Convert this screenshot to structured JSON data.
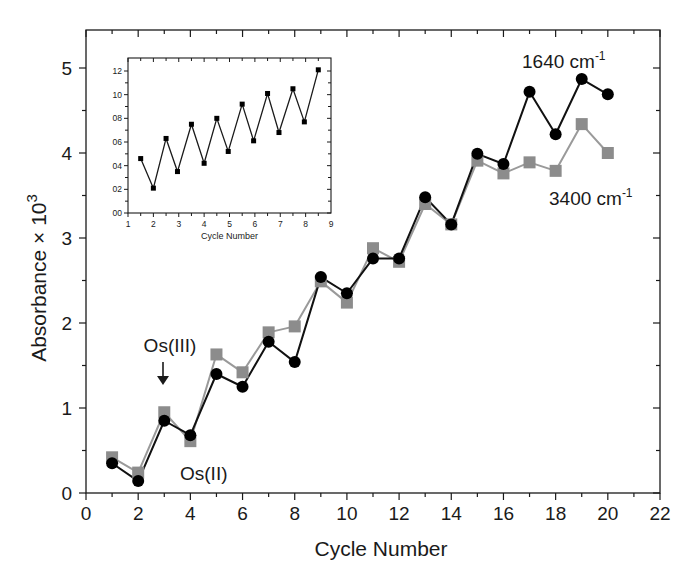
{
  "chart_data": [
    {
      "id": "main",
      "type": "line",
      "title": "",
      "xlabel": "Cycle Number",
      "ylabel": "Absorbance × 10",
      "ylabel_superscript": "3",
      "xlim": [
        0,
        22
      ],
      "ylim": [
        0,
        5.45
      ],
      "x_ticks": [
        0,
        2,
        4,
        6,
        8,
        10,
        12,
        14,
        16,
        18,
        20,
        22
      ],
      "y_ticks": [
        0,
        1,
        2,
        3,
        4,
        5
      ],
      "grid": false,
      "series": [
        {
          "name": "1640 cm-1",
          "label_main": "1640 cm",
          "label_sup": "-1",
          "marker": "circle",
          "color": "#000000",
          "line_color": "#111111",
          "x": [
            1,
            2,
            3,
            4,
            5,
            6,
            7,
            8,
            9,
            10,
            11,
            12,
            13,
            14,
            15,
            16,
            17,
            18,
            19,
            20
          ],
          "values": [
            0.35,
            0.14,
            0.85,
            0.68,
            1.4,
            1.25,
            1.78,
            1.54,
            2.54,
            2.35,
            2.76,
            2.76,
            3.48,
            3.16,
            3.99,
            3.87,
            4.72,
            4.22,
            4.87,
            4.69
          ]
        },
        {
          "name": "3400 cm-1",
          "label_main": "3400 cm",
          "label_sup": "-1",
          "marker": "square",
          "color": "#8c8c8c",
          "line_color": "#9a9a9a",
          "x": [
            1,
            2,
            3,
            4,
            5,
            6,
            7,
            8,
            9,
            10,
            11,
            12,
            13,
            14,
            15,
            16,
            17,
            18,
            19,
            20
          ],
          "values": [
            0.42,
            0.24,
            0.95,
            0.61,
            1.63,
            1.42,
            1.89,
            1.96,
            2.49,
            2.24,
            2.88,
            2.72,
            3.4,
            3.16,
            3.91,
            3.76,
            3.89,
            3.79,
            4.34,
            4.0
          ]
        }
      ],
      "annotations": [
        {
          "text": "Os(III)",
          "x": 3,
          "y": 1.62,
          "arrow_to_y": 1.05
        },
        {
          "text": "Os(II)",
          "x": 5.3,
          "y": 0.18
        }
      ]
    },
    {
      "id": "inset",
      "type": "line",
      "title": "",
      "xlabel": "Cycle Number",
      "ylabel": "",
      "xlim": [
        1,
        9
      ],
      "ylim": [
        0,
        1.3
      ],
      "x_ticks": [
        1,
        2,
        3,
        4,
        5,
        6,
        7,
        8,
        9
      ],
      "y_ticks": [
        0,
        0.2,
        0.4,
        0.6,
        0.8,
        1.0,
        1.2
      ],
      "y_tick_labels": [
        "00",
        "02",
        "04",
        "06",
        "08",
        "10",
        "12"
      ],
      "grid": false,
      "series": [
        {
          "name": "inset",
          "marker": "square",
          "color": "#000000",
          "x": [
            1.5,
            2,
            2.5,
            2.95,
            3.5,
            4,
            4.5,
            4.95,
            5.5,
            5.95,
            6.5,
            6.95,
            7.5,
            7.95,
            8.5
          ],
          "values": [
            0.46,
            0.21,
            0.63,
            0.35,
            0.75,
            0.42,
            0.8,
            0.52,
            0.92,
            0.61,
            1.01,
            0.68,
            1.05,
            0.77,
            1.21
          ]
        }
      ]
    }
  ]
}
